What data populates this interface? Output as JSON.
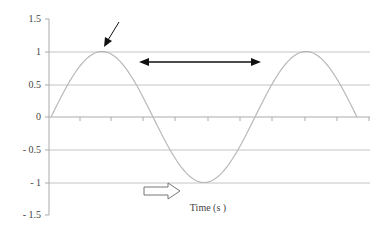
{
  "chart_data": {
    "type": "line",
    "title": "",
    "xlabel": "Time (s )",
    "ylabel": "",
    "ylim": [
      -1.5,
      1.5
    ],
    "yticks": [
      "1.5",
      "1",
      "0.5",
      "0",
      "- 0.5",
      "- 1",
      "- 1.5"
    ],
    "grid": true,
    "legend": null,
    "series": [
      {
        "name": "sine wave",
        "description": "One and a half cycles of a sinusoid: starts at 0, peaks at 1, troughs at -1, peaks at 1, returns to 0",
        "x": [
          0,
          0.25,
          0.5,
          0.75,
          1.0,
          1.25,
          1.5
        ],
        "values": [
          0,
          1,
          0,
          -1,
          0,
          1,
          0
        ]
      }
    ],
    "annotations": [
      {
        "type": "arrow",
        "description": "diagonal arrow pointing to first peak (crest)"
      },
      {
        "type": "double-arrow",
        "description": "horizontal double-headed arrow spanning from first peak to second peak (wavelength/period)"
      },
      {
        "type": "hollow-arrow",
        "description": "outlined arrow pointing right near x-axis title indicating direction of time"
      }
    ]
  },
  "axis": {
    "x_title": "Time (s )",
    "y_ticks": [
      {
        "label": "1.5",
        "value": 1.5
      },
      {
        "label": "1",
        "value": 1
      },
      {
        "label": "0.5",
        "value": 0.5
      },
      {
        "label": "0",
        "value": 0
      },
      {
        "label": "- 0.5",
        "value": -0.5
      },
      {
        "label": "- 1",
        "value": -1
      },
      {
        "label": "- 1.5",
        "value": -1.5
      }
    ]
  },
  "colors": {
    "curve": "#b8b8b8",
    "grid": "#c4c4c4",
    "axis": "#aaaaaa",
    "arrow": "#111111",
    "text": "#444444"
  }
}
